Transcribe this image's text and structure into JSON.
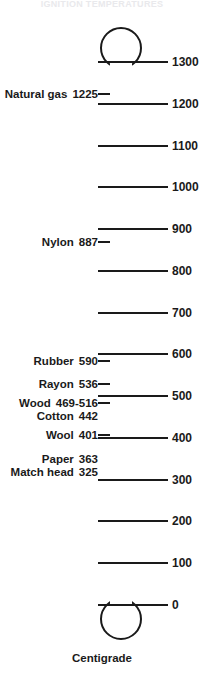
{
  "figure": {
    "title_strip": "IGNITION TEMPERATURES",
    "caption": "Centigrade",
    "unit": "Centigrade"
  },
  "chart_data": {
    "type": "bar",
    "title": "Ignition temperatures",
    "subtitle": "Centigrade",
    "xlabel": "",
    "ylabel": "Centigrade",
    "ylim": [
      0,
      1300
    ],
    "grid": true,
    "legend": "none",
    "orientation": "vertical-thermometer",
    "axis_ticks": [
      0,
      100,
      200,
      300,
      400,
      500,
      600,
      700,
      800,
      900,
      1000,
      1100,
      1200,
      1300
    ],
    "axis_tick_labels": [
      "0",
      "100",
      "200",
      "300",
      "400",
      "500",
      "600",
      "700",
      "800",
      "900",
      "1000",
      "1100",
      "1200",
      "1300"
    ],
    "categories": [
      "Natural gas",
      "Nylon",
      "Rubber",
      "Rayon",
      "Wood",
      "Cotton",
      "Wool",
      "Paper",
      "Match head"
    ],
    "values": [
      1225,
      887,
      590,
      536,
      492.5,
      442,
      401,
      363,
      325
    ],
    "value_labels": [
      "1225",
      "887",
      "590",
      "536",
      "469-516",
      "442",
      "401",
      "363",
      "325"
    ]
  },
  "scale": {
    "ticks": [
      {
        "label": "1300",
        "value": 1300
      },
      {
        "label": "1200",
        "value": 1200
      },
      {
        "label": "1100",
        "value": 1100
      },
      {
        "label": "1000",
        "value": 1000
      },
      {
        "label": "900",
        "value": 900
      },
      {
        "label": "800",
        "value": 800
      },
      {
        "label": "700",
        "value": 700
      },
      {
        "label": "600",
        "value": 600
      },
      {
        "label": "500",
        "value": 500
      },
      {
        "label": "400",
        "value": 400
      },
      {
        "label": "300",
        "value": 300
      },
      {
        "label": "200",
        "value": 200
      },
      {
        "label": "100",
        "value": 100
      },
      {
        "label": "0",
        "value": 0
      }
    ]
  },
  "materials": [
    {
      "name": "Natural gas",
      "value": "1225",
      "leader": true
    },
    {
      "name": "Nylon",
      "value": "887",
      "leader": true
    },
    {
      "name": "Rubber",
      "value": "590",
      "leader": true
    },
    {
      "name": "Rayon",
      "value": "536",
      "leader": true
    },
    {
      "name": "Wood",
      "value": "469-516",
      "leader": true
    },
    {
      "name": "Cotton",
      "value": "442",
      "leader": false
    },
    {
      "name": "Wool",
      "value": "401",
      "leader": true
    },
    {
      "name": "Paper",
      "value": "363",
      "leader": false
    },
    {
      "name": "Match head",
      "value": "325",
      "leader": false
    }
  ],
  "colors": {
    "ink": "#1a1a1a",
    "background": "#ffffff"
  }
}
